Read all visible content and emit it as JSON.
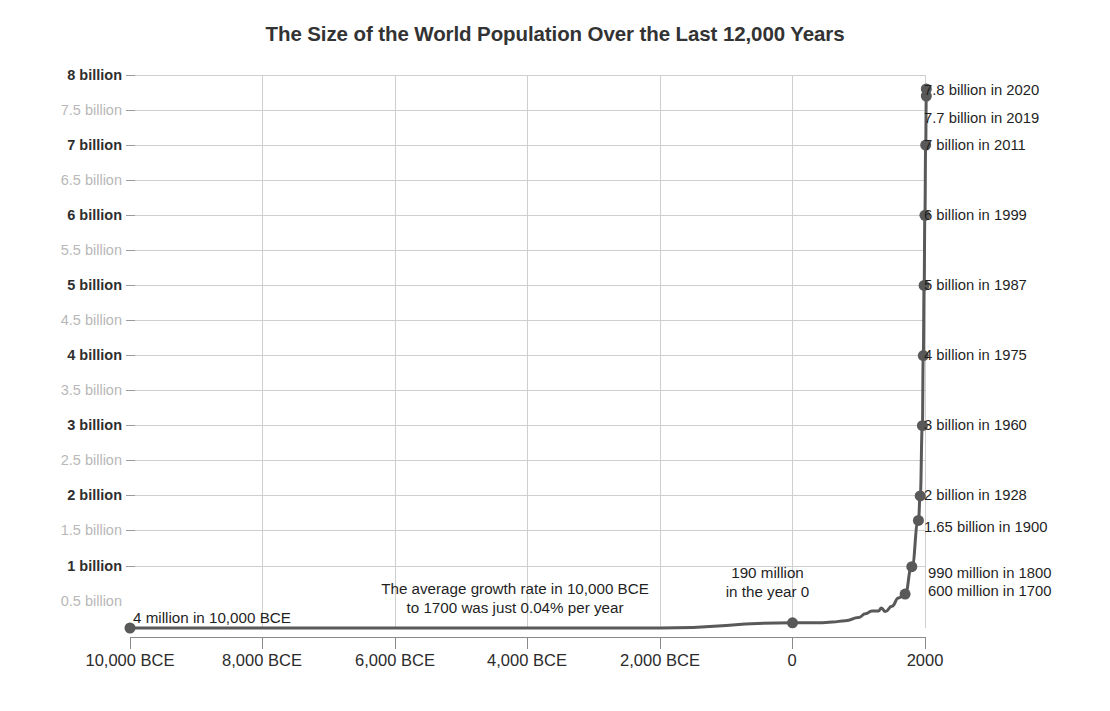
{
  "chart_data": {
    "type": "line",
    "title": "The Size of the World Population Over the Last 12,000 Years",
    "xlabel": "",
    "ylabel": "",
    "xlim": [
      -10000,
      2020
    ],
    "ylim": [
      0,
      8000000000
    ],
    "grid": true,
    "legend": "none",
    "x": [
      -10000,
      -8000,
      -6000,
      -4000,
      -2000,
      0,
      200,
      400,
      600,
      800,
      1000,
      1100,
      1200,
      1300,
      1340,
      1400,
      1500,
      1600,
      1700,
      1800,
      1900,
      1928,
      1960,
      1975,
      1987,
      1999,
      2011,
      2019,
      2020
    ],
    "values": [
      4000000,
      5000000,
      7000000,
      19000000,
      27000000,
      190000000,
      190000000,
      190000000,
      200000000,
      220000000,
      265000000,
      320000000,
      360000000,
      360000000,
      400000000,
      350000000,
      425000000,
      545000000,
      600000000,
      990000000,
      1650000000,
      2000000000,
      3000000000,
      4000000000,
      5000000000,
      6000000000,
      7000000000,
      7700000000,
      7800000000
    ],
    "x_tick_labels": [
      "10,000 BCE",
      "8,000 BCE",
      "6,000 BCE",
      "4,000 BCE",
      "2,000 BCE",
      "0",
      "2000"
    ],
    "x_tick_values": [
      -10000,
      -8000,
      -6000,
      -4000,
      -2000,
      0,
      2000
    ],
    "y_tick_labels": [
      "8 billion",
      "7.5 billion",
      "7 billion",
      "6.5 billion",
      "6 billion",
      "5.5 billion",
      "5 billion",
      "4.5 billion",
      "4 billion",
      "3.5 billion",
      "3 billion",
      "2.5 billion",
      "2 billion",
      "1.5 billion",
      "1 billion",
      "0.5 billion"
    ],
    "y_tick_values": [
      8,
      7.5,
      7,
      6.5,
      6,
      5.5,
      5,
      4.5,
      4,
      3.5,
      3,
      2.5,
      2,
      1.5,
      1,
      0.5
    ],
    "y_tick_major": [
      true,
      false,
      true,
      false,
      true,
      false,
      true,
      false,
      true,
      false,
      true,
      false,
      true,
      false,
      true,
      false
    ],
    "data_labels": [
      {
        "text": "7.8 billion in 2020",
        "year": 2020,
        "value": 7.8
      },
      {
        "text": "7.7 billion in 2019",
        "year": 2019,
        "value": 7.7
      },
      {
        "text": "7 billion in 2011",
        "year": 2011,
        "value": 7.0
      },
      {
        "text": "6 billion in 1999",
        "year": 1999,
        "value": 6.0
      },
      {
        "text": "5 billion in 1987",
        "year": 1987,
        "value": 5.0
      },
      {
        "text": "4 billion in 1975",
        "year": 1975,
        "value": 4.0
      },
      {
        "text": "3 billion in 1960",
        "year": 1960,
        "value": 3.0
      },
      {
        "text": "2 billion in 1928",
        "year": 1928,
        "value": 2.0
      },
      {
        "text": "1.65 billion in 1900",
        "year": 1900,
        "value": 1.65
      },
      {
        "text": "990 million in 1800",
        "year": 1800,
        "value": 0.99
      },
      {
        "text": "600 million in 1700",
        "year": 1700,
        "value": 0.6
      }
    ],
    "annotations": [
      {
        "name": "start-point-label",
        "text": "4 million in 10,000 BCE"
      },
      {
        "name": "growth-rate-note",
        "line1": "The average growth rate in 10,000 BCE",
        "line2": "to 1700 was just 0.04% per year"
      },
      {
        "name": "year-zero-label",
        "line1": "190 million",
        "line2": "in the year 0"
      }
    ],
    "colors": {
      "line": "#595959",
      "marker": "#595959",
      "grid": "#cfcfcf",
      "axis": "#8a8a8a",
      "label_major": "#2e2e2e",
      "label_minor": "#b8b8b8",
      "title": "#333333",
      "background": "#ffffff"
    }
  },
  "yticks": [
    {
      "label": "8 billion",
      "major": true,
      "top": 75
    },
    {
      "label": "7.5 billion",
      "major": false,
      "top": 110
    },
    {
      "label": "7 billion",
      "major": true,
      "top": 145
    },
    {
      "label": "6.5 billion",
      "major": false,
      "top": 180
    },
    {
      "label": "6 billion",
      "major": true,
      "top": 215
    },
    {
      "label": "5.5 billion",
      "major": false,
      "top": 250
    },
    {
      "label": "5 billion",
      "major": true,
      "top": 285
    },
    {
      "label": "4.5 billion",
      "major": false,
      "top": 320
    },
    {
      "label": "4 billion",
      "major": true,
      "top": 355
    },
    {
      "label": "3.5 billion",
      "major": false,
      "top": 390
    },
    {
      "label": "3 billion",
      "major": true,
      "top": 425
    },
    {
      "label": "2.5 billion",
      "major": false,
      "top": 460
    },
    {
      "label": "2 billion",
      "major": true,
      "top": 495
    },
    {
      "label": "1.5 billion",
      "major": false,
      "top": 530
    },
    {
      "label": "1 billion",
      "major": true,
      "top": 566
    },
    {
      "label": "0.5 billion",
      "major": false,
      "top": 601
    }
  ],
  "xticks": [
    {
      "label": "10,000 BCE",
      "left": 130
    },
    {
      "label": "8,000 BCE",
      "left": 262
    },
    {
      "label": "6,000 BCE",
      "left": 395
    },
    {
      "label": "4,000 BCE",
      "left": 527
    },
    {
      "label": "2,000 BCE",
      "left": 660
    },
    {
      "label": "0",
      "left": 792
    },
    {
      "label": "2000",
      "left": 925
    }
  ],
  "callouts": [
    {
      "label": "7.8 billion in 2020",
      "top": 90,
      "left": 924
    },
    {
      "label": "7.7 billion in 2019",
      "top": 118,
      "left": 924
    },
    {
      "label": "7 billion in 2011",
      "top": 145,
      "left": 924
    },
    {
      "label": "6 billion in 1999",
      "top": 215,
      "left": 924
    },
    {
      "label": "5 billion in 1987",
      "top": 285,
      "left": 924
    },
    {
      "label": "4 billion in 1975",
      "top": 355,
      "left": 924
    },
    {
      "label": "3 billion in 1960",
      "top": 425,
      "left": 924
    },
    {
      "label": "2 billion in 1928",
      "top": 495,
      "left": 924
    },
    {
      "label": "1.65 billion in 1900",
      "top": 527,
      "left": 924
    },
    {
      "label": "990 million in 1800",
      "top": 573,
      "left": 928
    },
    {
      "label": "600 million in 1700",
      "top": 591,
      "left": 928
    }
  ],
  "annotations": {
    "start_label": "4 million in 10,000 BCE",
    "growth_line1": "The average growth rate in 10,000 BCE",
    "growth_line2": "to 1700 was just 0.04% per year",
    "year0_line1": "190 million",
    "year0_line2": "in the year 0"
  },
  "title": "The Size of the World Population Over the Last 12,000 Years"
}
